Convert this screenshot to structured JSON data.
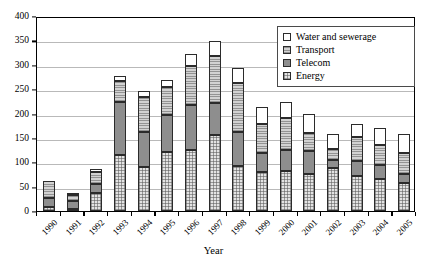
{
  "chart_data": {
    "type": "bar",
    "subtype": "stacked-column",
    "title": "",
    "xlabel": "Year",
    "ylabel": "",
    "ylim": [
      0,
      400
    ],
    "ytick_step": 50,
    "yticks": [
      0,
      50,
      100,
      150,
      200,
      250,
      300,
      350,
      400
    ],
    "grid": "horizontal",
    "legend_position": "top-right",
    "categories": [
      "1990",
      "1991",
      "1992",
      "1993",
      "1994",
      "1995",
      "1996",
      "1997",
      "1998",
      "1999",
      "2000",
      "2001",
      "2002",
      "2003",
      "2004",
      "2005"
    ],
    "series": [
      {
        "name": "Energy",
        "values": [
          8,
          5,
          37,
          115,
          91,
          121,
          126,
          156,
          93,
          81,
          82,
          76,
          89,
          71,
          66,
          58
        ]
      },
      {
        "name": "Telecom",
        "values": [
          18,
          16,
          19,
          109,
          72,
          75,
          91,
          65,
          70,
          39,
          44,
          48,
          15,
          32,
          28,
          17
        ]
      },
      {
        "name": "Transport",
        "values": [
          35,
          12,
          25,
          42,
          71,
          58,
          81,
          97,
          99,
          58,
          64,
          37,
          23,
          48,
          41,
          43
        ]
      },
      {
        "name": "Water and sewerage",
        "values": [
          0,
          1,
          6,
          11,
          13,
          15,
          24,
          30,
          31,
          36,
          34,
          37,
          31,
          27,
          36,
          40
        ]
      }
    ],
    "totals": [
      61,
      34,
      87,
      277,
      247,
      269,
      322,
      348,
      293,
      214,
      224,
      198,
      158,
      178,
      171,
      158
    ]
  },
  "legend": {
    "items": [
      {
        "label": "Water and sewerage",
        "key": "water"
      },
      {
        "label": "Transport",
        "key": "transport"
      },
      {
        "label": "Telecom",
        "key": "telecom"
      },
      {
        "label": "Energy",
        "key": "energy"
      }
    ]
  },
  "axis": {
    "x_title": "Year"
  },
  "colors": {
    "energy": "#e3e3e3",
    "telecom": "#8e8e8e",
    "transport": "#d2d2d2",
    "water": "#ffffff",
    "gridline": "#b9b9b9",
    "axis": "#000000"
  }
}
